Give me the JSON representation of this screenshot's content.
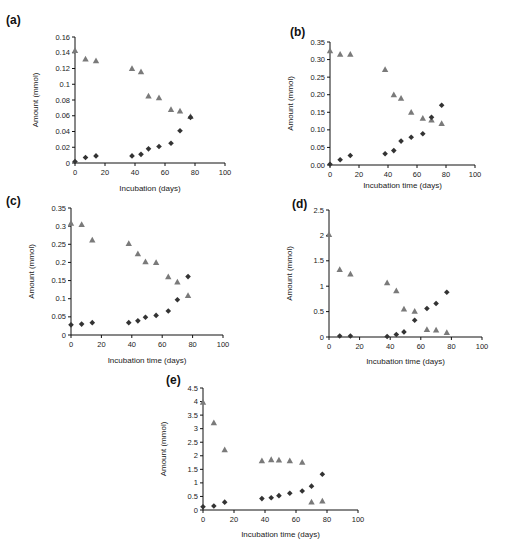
{
  "chart_data": [
    {
      "type": "scatter",
      "panel": "(a)",
      "title": "",
      "xlabel": "Incubation (days)",
      "ylabel": "Amount (mmol)",
      "xlim": [
        0,
        100
      ],
      "ylim": [
        0,
        0.16
      ],
      "xticks": [
        "0",
        "20",
        "40",
        "60",
        "80",
        "100"
      ],
      "yticks": [
        "0",
        "0.02",
        "0.04",
        "0.06",
        "0.08",
        "0.1",
        "0.12",
        "0.14",
        "0.16"
      ],
      "grid": false,
      "series": [
        {
          "name": "triangle",
          "marker": "triangle",
          "color": "#7a7a7a",
          "x": [
            0,
            7,
            14,
            38,
            44,
            49,
            56,
            64,
            70,
            77
          ],
          "y": [
            0.143,
            0.132,
            0.13,
            0.12,
            0.116,
            0.085,
            0.083,
            0.068,
            0.066,
            0.059
          ]
        },
        {
          "name": "diamond",
          "marker": "diamond",
          "color": "#333333",
          "x": [
            0,
            7,
            14,
            38,
            44,
            49,
            56,
            64,
            70,
            77
          ],
          "y": [
            0.002,
            0.007,
            0.009,
            0.009,
            0.011,
            0.018,
            0.021,
            0.025,
            0.041,
            0.058
          ]
        }
      ]
    },
    {
      "type": "scatter",
      "panel": "(b)",
      "title": "",
      "xlabel": "Incubation time (days)",
      "ylabel": "Amount (mmol)",
      "xlim": [
        0,
        100
      ],
      "ylim": [
        0,
        0.35
      ],
      "xticks": [
        "0",
        "20",
        "40",
        "60",
        "80",
        "100"
      ],
      "yticks": [
        "0.00",
        "0.05",
        "0.10",
        "0.15",
        "0.20",
        "0.25",
        "0.30",
        "0.35"
      ],
      "grid": false,
      "series": [
        {
          "name": "triangle",
          "marker": "triangle",
          "color": "#7a7a7a",
          "x": [
            0,
            7,
            14,
            38,
            44,
            49,
            56,
            64,
            70,
            77
          ],
          "y": [
            0.325,
            0.315,
            0.315,
            0.272,
            0.2,
            0.19,
            0.15,
            0.133,
            0.128,
            0.118
          ]
        },
        {
          "name": "diamond",
          "marker": "diamond",
          "color": "#333333",
          "x": [
            0,
            7,
            14,
            38,
            44,
            49,
            56,
            64,
            70,
            77
          ],
          "y": [
            0.002,
            0.015,
            0.027,
            0.032,
            0.041,
            0.068,
            0.079,
            0.089,
            0.136,
            0.17
          ]
        }
      ]
    },
    {
      "type": "scatter",
      "panel": "(c)",
      "title": "",
      "xlabel": "Incubation time (days)",
      "ylabel": "Amount (mmol)",
      "xlim": [
        0,
        100
      ],
      "ylim": [
        0,
        0.35
      ],
      "xticks": [
        "0",
        "20",
        "40",
        "60",
        "80",
        "100"
      ],
      "yticks": [
        "0",
        "0.05",
        "0.1",
        "0.15",
        "0.2",
        "0.25",
        "0.3",
        "0.35"
      ],
      "grid": false,
      "series": [
        {
          "name": "triangle",
          "marker": "triangle",
          "color": "#7a7a7a",
          "x": [
            0,
            7,
            14,
            38,
            44,
            49,
            56,
            64,
            70,
            77
          ],
          "y": [
            0.308,
            0.305,
            0.262,
            0.252,
            0.224,
            0.202,
            0.2,
            0.161,
            0.146,
            0.109
          ]
        },
        {
          "name": "diamond",
          "marker": "diamond",
          "color": "#333333",
          "x": [
            0,
            7,
            14,
            38,
            44,
            49,
            56,
            64,
            70,
            77
          ],
          "y": [
            0.028,
            0.03,
            0.034,
            0.034,
            0.039,
            0.049,
            0.054,
            0.066,
            0.097,
            0.161
          ]
        }
      ]
    },
    {
      "type": "scatter",
      "panel": "(d)",
      "title": "",
      "xlabel": "Incubation time (days)",
      "ylabel": "Amount (mmol)",
      "xlim": [
        0,
        100
      ],
      "ylim": [
        0,
        2.5
      ],
      "xticks": [
        "0",
        "20",
        "40",
        "60",
        "80",
        "100"
      ],
      "yticks": [
        "0",
        "0.5",
        "1",
        "1.5",
        "2",
        "2.5"
      ],
      "grid": false,
      "series": [
        {
          "name": "triangle",
          "marker": "triangle",
          "color": "#7a7a7a",
          "x": [
            0,
            7,
            14,
            38,
            44,
            49,
            56,
            64,
            70,
            77
          ],
          "y": [
            2.02,
            1.33,
            1.24,
            1.07,
            0.91,
            0.55,
            0.51,
            0.15,
            0.14,
            0.09
          ]
        },
        {
          "name": "diamond",
          "marker": "diamond",
          "color": "#333333",
          "x": [
            7,
            14,
            38,
            44,
            49,
            56,
            64,
            70,
            77
          ],
          "y": [
            0.02,
            0.02,
            0.01,
            0.05,
            0.1,
            0.33,
            0.56,
            0.66,
            0.88
          ]
        }
      ]
    },
    {
      "type": "scatter",
      "panel": "(e)",
      "title": "",
      "xlabel": "Incubation time (days)",
      "ylabel": "Amount (mmol)",
      "xlim": [
        0,
        100
      ],
      "ylim": [
        0,
        4.5
      ],
      "xticks": [
        "0",
        "20",
        "40",
        "60",
        "80",
        "100"
      ],
      "yticks": [
        "0",
        "0.5",
        "1",
        "1.5",
        "2",
        "2.5",
        "3",
        "3.5",
        "4",
        "4.5"
      ],
      "grid": false,
      "series": [
        {
          "name": "triangle",
          "marker": "triangle",
          "color": "#7a7a7a",
          "x": [
            0,
            7,
            14,
            38,
            44,
            49,
            56,
            64,
            70,
            77
          ],
          "y": [
            3.98,
            3.22,
            2.22,
            1.82,
            1.86,
            1.85,
            1.82,
            1.76,
            0.3,
            0.33
          ]
        },
        {
          "name": "diamond",
          "marker": "diamond",
          "color": "#333333",
          "x": [
            0,
            7,
            14,
            38,
            44,
            49,
            56,
            64,
            70,
            77
          ],
          "y": [
            0.12,
            0.15,
            0.29,
            0.42,
            0.45,
            0.53,
            0.62,
            0.7,
            0.88,
            1.32
          ]
        }
      ]
    }
  ]
}
